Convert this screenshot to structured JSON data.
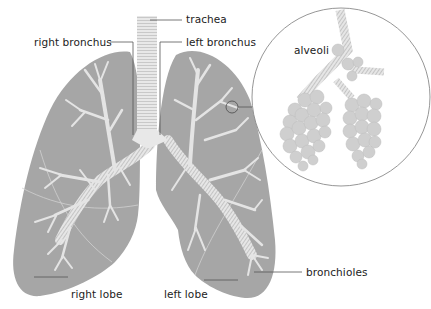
{
  "diagram": {
    "type": "anatomical-illustration",
    "colors": {
      "lung_fill": "#a6a6a6",
      "airway": "#e4e4e4",
      "leader_line": "#555555",
      "inset_circle": "#8a8a8a",
      "alveoli": "#d2d2d2",
      "text": "#222222"
    },
    "labels": {
      "trachea": "trachea",
      "right_bronchus": "right bronchus",
      "left_bronchus": "left bronchus",
      "alveoli": "alveoli",
      "bronchioles": "bronchioles",
      "right_lobe": "right lobe",
      "left_lobe": "left lobe"
    },
    "inset": {
      "description": "magnified view of alveoli",
      "center": [
        341,
        97
      ],
      "radius": 91
    }
  }
}
